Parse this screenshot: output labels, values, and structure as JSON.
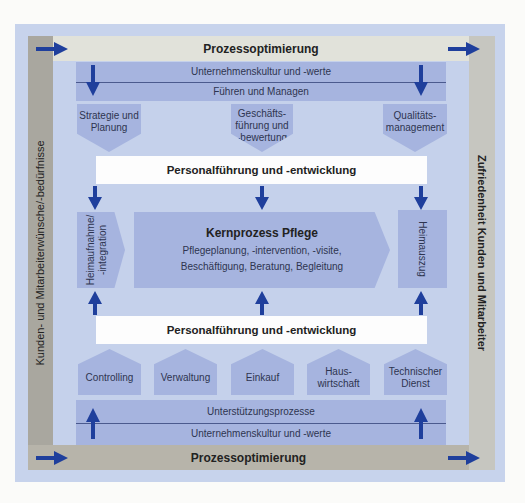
{
  "diagram": {
    "top_band": "Prozessoptimierung",
    "bottom_band": "Prozessoptimierung",
    "left_bar": "Kunden- und Mitarbeiterwünsche/-bedürfnisse",
    "right_bar": "Zufriedenheit Kunden und Mitarbeiter",
    "management": {
      "row1": "Unternehmenskultur und -werte",
      "row2": "Führen und Managen",
      "chevrons": [
        {
          "line1": "Strategie und",
          "line2": "Planung",
          "line3": ""
        },
        {
          "line1": "Geschäfts-",
          "line2": "führung und",
          "line3": "-bewertung"
        },
        {
          "line1": "Qualitäts-",
          "line2": "management",
          "line3": ""
        }
      ]
    },
    "personal_top": "Personalführung und -entwicklung",
    "core": {
      "admission_line1": "Heimaufnahme/",
      "admission_line2": "-integration",
      "title": "Kernprozess Pflege",
      "line1": "Pflegeplanung, -intervention, -visite,",
      "line2": "Beschäftigung, Beratung, Begleitung",
      "departure": "Heimauszug"
    },
    "personal_bottom": "Personalführung und -entwicklung",
    "support": {
      "houses": [
        {
          "line1": "Controlling",
          "line2": ""
        },
        {
          "line1": "Verwaltung",
          "line2": ""
        },
        {
          "line1": "Einkauf",
          "line2": ""
        },
        {
          "line1": "Haus-",
          "line2": "wirtschaft"
        },
        {
          "line1": "Technischer",
          "line2": "Dienst"
        }
      ],
      "row1": "Unterstützungsprozesse",
      "row2": "Unternehmenskultur und -werte"
    },
    "colors": {
      "outer_bg": "#c7d3ec",
      "box_blue": "#a6b4df",
      "arrow_blue": "#1f3f9c",
      "gray_dark": "#a9a79f",
      "gray_light": "#e1e2da"
    }
  }
}
